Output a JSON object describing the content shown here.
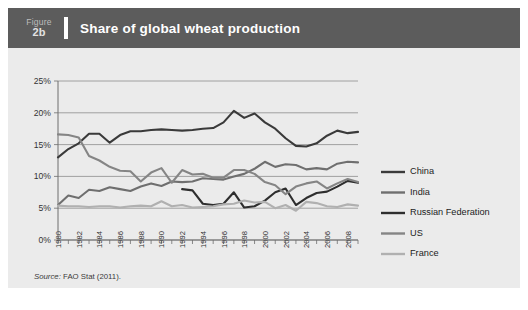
{
  "figure": {
    "number_word": "Figure",
    "number": "2b",
    "title": "Share of global wheat production"
  },
  "source": {
    "label": "Source:",
    "text": "FAO Stat (2011)."
  },
  "legend": {
    "position": "right",
    "entries": [
      {
        "label": "China",
        "color": "#3a3a3a"
      },
      {
        "label": "India",
        "color": "#6f6f6f"
      },
      {
        "label": "Russian Federation",
        "color": "#2e2e2e"
      },
      {
        "label": "US",
        "color": "#858585"
      },
      {
        "label": "France",
        "color": "#b0b0b0"
      }
    ]
  },
  "chart_data": {
    "type": "line",
    "title": "Share of global wheat production",
    "xlabel": "",
    "ylabel": "",
    "ylim": [
      0,
      25
    ],
    "yticks": [
      "0%",
      "5%",
      "10%",
      "15%",
      "20%",
      "25%"
    ],
    "ytick_values": [
      0,
      5,
      10,
      15,
      20,
      25
    ],
    "xlim": [
      1980,
      2009
    ],
    "xticks": [
      "1980",
      "1982",
      "1984",
      "1986",
      "1988",
      "1990",
      "1992",
      "1994",
      "1996",
      "1998",
      "2000",
      "2002",
      "2004",
      "2006",
      "2008"
    ],
    "xtick_values": [
      1980,
      1982,
      1984,
      1986,
      1988,
      1990,
      1992,
      1994,
      1996,
      1998,
      2000,
      2002,
      2004,
      2006,
      2008
    ],
    "x": [
      1980,
      1981,
      1982,
      1983,
      1984,
      1985,
      1986,
      1987,
      1988,
      1989,
      1990,
      1991,
      1992,
      1993,
      1994,
      1995,
      1996,
      1997,
      1998,
      1999,
      2000,
      2001,
      2002,
      2003,
      2004,
      2005,
      2006,
      2007,
      2008,
      2009
    ],
    "grid": true,
    "legend_position": "right",
    "series": [
      {
        "name": "China",
        "color": "#3a3a3a",
        "values": [
          13.0,
          14.3,
          15.2,
          16.7,
          16.7,
          15.3,
          16.5,
          17.1,
          17.1,
          17.3,
          17.4,
          17.3,
          17.2,
          17.3,
          17.5,
          17.6,
          18.5,
          20.3,
          19.2,
          19.9,
          18.5,
          17.5,
          16.0,
          14.8,
          14.7,
          15.2,
          16.4,
          17.2,
          16.8,
          17.0
        ]
      },
      {
        "name": "India",
        "color": "#6f6f6f",
        "values": [
          5.5,
          7.0,
          6.6,
          7.9,
          7.7,
          8.3,
          8.0,
          7.7,
          8.4,
          8.9,
          8.5,
          9.2,
          9.1,
          9.2,
          9.7,
          9.6,
          9.5,
          10.0,
          10.4,
          11.2,
          12.3,
          11.5,
          11.9,
          11.8,
          11.1,
          11.3,
          11.1,
          12.0,
          12.3,
          12.2
        ]
      },
      {
        "name": "Russian Federation",
        "color": "#2e2e2e",
        "values": [
          null,
          null,
          null,
          null,
          null,
          null,
          null,
          null,
          null,
          null,
          null,
          null,
          8.0,
          7.8,
          5.7,
          5.5,
          5.7,
          7.5,
          5.1,
          5.3,
          6.2,
          7.5,
          8.1,
          5.5,
          6.6,
          7.4,
          7.6,
          8.4,
          9.3,
          9.0
        ]
      },
      {
        "name": "US",
        "color": "#858585",
        "values": [
          16.6,
          16.5,
          16.1,
          13.2,
          12.5,
          11.5,
          10.9,
          10.8,
          9.2,
          10.6,
          11.3,
          9.0,
          11.0,
          10.3,
          10.4,
          9.8,
          9.8,
          11.0,
          11.0,
          10.4,
          9.1,
          8.6,
          7.2,
          8.4,
          8.9,
          9.2,
          8.1,
          8.9,
          9.6,
          9.1
        ]
      },
      {
        "name": "France",
        "color": "#b0b0b0",
        "values": [
          5.4,
          5.3,
          5.3,
          5.2,
          5.3,
          5.3,
          5.1,
          5.3,
          5.4,
          5.3,
          6.1,
          5.3,
          5.5,
          5.1,
          5.2,
          5.3,
          5.6,
          5.7,
          6.2,
          5.9,
          6.0,
          5.0,
          5.5,
          4.6,
          6.0,
          5.8,
          5.3,
          5.2,
          5.6,
          5.4
        ]
      }
    ]
  }
}
